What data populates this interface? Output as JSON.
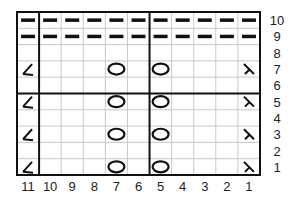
{
  "chart": {
    "title": "",
    "columns": 11,
    "rows": 10,
    "column_labels": [
      "11",
      "10",
      "9",
      "8",
      "7",
      "6",
      "5",
      "4",
      "3",
      "2",
      "1"
    ],
    "row_labels": [
      "10",
      "9",
      "8",
      "7",
      "6",
      "5",
      "4",
      "3",
      "2",
      "1"
    ],
    "colors": {
      "grid": "#c8c8c8",
      "border": "#111111",
      "symbol": "#111111"
    },
    "symbols": {
      "purl": "dash",
      "yo": "circle",
      "k2tog": "left-lean",
      "ssk": "right-lean"
    },
    "cells": [
      {
        "row": 10,
        "col": "all",
        "symbol": "purl"
      },
      {
        "row": 9,
        "col": "all",
        "symbol": "purl"
      },
      {
        "row": 7,
        "col": 11,
        "symbol": "k2tog"
      },
      {
        "row": 7,
        "col": 7,
        "symbol": "yo"
      },
      {
        "row": 7,
        "col": 5,
        "symbol": "yo"
      },
      {
        "row": 7,
        "col": 1,
        "symbol": "ssk"
      },
      {
        "row": 5,
        "col": 11,
        "symbol": "k2tog"
      },
      {
        "row": 5,
        "col": 7,
        "symbol": "yo"
      },
      {
        "row": 5,
        "col": 5,
        "symbol": "yo"
      },
      {
        "row": 5,
        "col": 1,
        "symbol": "ssk"
      },
      {
        "row": 3,
        "col": 11,
        "symbol": "k2tog"
      },
      {
        "row": 3,
        "col": 7,
        "symbol": "yo"
      },
      {
        "row": 3,
        "col": 5,
        "symbol": "yo"
      },
      {
        "row": 3,
        "col": 1,
        "symbol": "ssk"
      },
      {
        "row": 1,
        "col": 11,
        "symbol": "k2tog"
      },
      {
        "row": 1,
        "col": 7,
        "symbol": "yo"
      },
      {
        "row": 1,
        "col": 5,
        "symbol": "yo"
      },
      {
        "row": 1,
        "col": 1,
        "symbol": "ssk"
      }
    ]
  }
}
